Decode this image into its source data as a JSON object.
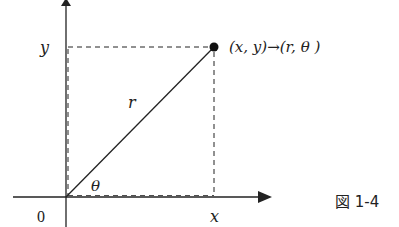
{
  "diagram": {
    "labels": {
      "y_axis_value": "y",
      "x_axis_value": "x",
      "origin": "0",
      "radius": "r",
      "angle": "θ",
      "point_label": "(x, y)→(r, θ )"
    },
    "caption": "図 1-4",
    "colors": {
      "stroke": "#222222",
      "background": "#ffffff"
    }
  }
}
